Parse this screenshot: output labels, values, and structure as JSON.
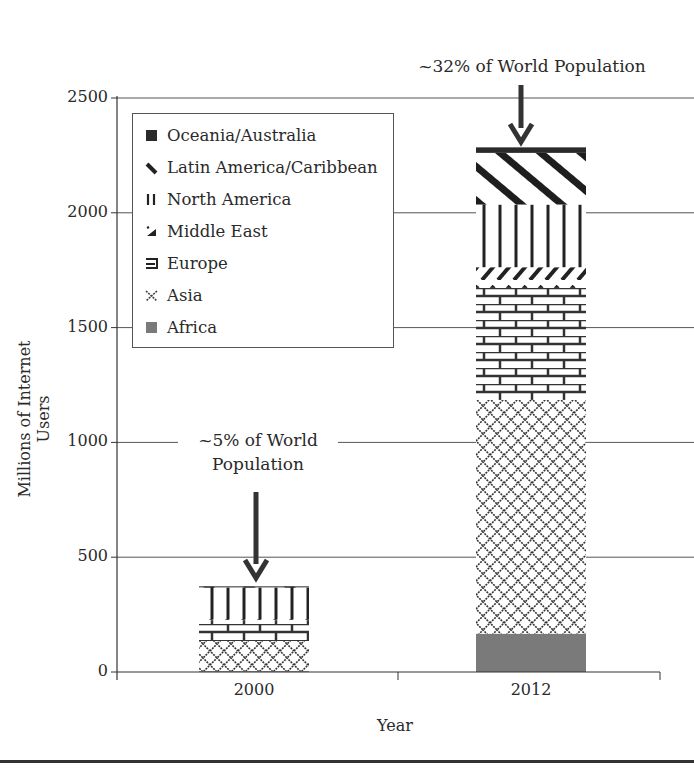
{
  "chart_data": {
    "type": "bar",
    "stacked": true,
    "title": "",
    "xlabel": "Year",
    "ylabel": "Millions of Internet Users",
    "ylim": [
      0,
      2500
    ],
    "yticks": [
      0,
      500,
      1000,
      1500,
      2000,
      2500
    ],
    "grid": "horizontal",
    "legend_position": "upper-left inside",
    "categories": [
      "2000",
      "2012"
    ],
    "series": [
      {
        "name": "Africa",
        "pattern": "solid-gray",
        "values": [
          4,
          167
        ]
      },
      {
        "name": "Asia",
        "pattern": "diamond-lattice",
        "values": [
          131,
          1018
        ]
      },
      {
        "name": "Europe",
        "pattern": "brick",
        "values": [
          92,
          488
        ]
      },
      {
        "name": "Middle East",
        "pattern": "diagonal-dashes",
        "values": [
          3,
          90
        ]
      },
      {
        "name": "North America",
        "pattern": "vertical-lines",
        "values": [
          140,
          273
        ]
      },
      {
        "name": "Latin America/Caribbean",
        "pattern": "diagonal-stripes",
        "values": [
          2,
          225
        ]
      },
      {
        "name": "Oceania/Australia",
        "pattern": "solid-dark",
        "values": [
          1,
          24
        ]
      }
    ],
    "totals": [
      370,
      2285
    ],
    "annotations": [
      {
        "text": "~5% of World Population",
        "target": "2000"
      },
      {
        "text": "~32% of World Population",
        "target": "2012"
      }
    ]
  },
  "labels": {
    "ylabel": "Millions of Internet Users",
    "xlabel": "Year",
    "yticks": [
      "0",
      "500",
      "1000",
      "1500",
      "2000",
      "2500"
    ],
    "xticks": [
      "2000",
      "2012"
    ],
    "ann_2012": "~32% of World Population",
    "ann_2000_line1": "~5% of World",
    "ann_2000_line2": "Population"
  },
  "legend": [
    "Oceania/Australia",
    "Latin America/Caribbean",
    "North America",
    "Middle East",
    "Europe",
    "Asia",
    "Africa"
  ]
}
